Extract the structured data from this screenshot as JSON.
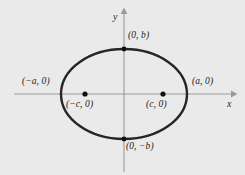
{
  "figure": {
    "type": "ellipse-diagram",
    "background_color": "#eaeaea",
    "curve_color": "#262626",
    "axis_color": "#9a9a9a",
    "point_color": "#111111",
    "text_color": "#1a1a1a"
  },
  "axes": {
    "x_label": "x",
    "y_label": "y",
    "origin_px": {
      "x": 124,
      "y": 94
    },
    "x_axis_from_px": 14,
    "x_axis_to_px": 236,
    "y_axis_from_px": 10,
    "y_axis_to_px": 172,
    "x_arrow": "arrow-right",
    "y_arrow": "arrow-up"
  },
  "chart_data": {
    "type": "scatter",
    "title": "",
    "xlabel": "x",
    "ylabel": "y",
    "curve": {
      "kind": "ellipse",
      "center": [
        0,
        0
      ],
      "semi_major_a": "a",
      "semi_minor_b": "b",
      "semi_major_px": 63,
      "semi_minor_px": 45,
      "center_px": [
        124,
        94
      ]
    },
    "points": [
      {
        "name": "vertex-right",
        "label": "(a, 0)",
        "px": [
          187,
          94
        ],
        "dot": false,
        "label_px": [
          192,
          77
        ]
      },
      {
        "name": "vertex-left",
        "label": "(−a, 0)",
        "px": [
          61,
          94
        ],
        "dot": false,
        "label_px": [
          22,
          77
        ]
      },
      {
        "name": "covertex-top",
        "label": "(0, b)",
        "px": [
          124,
          49
        ],
        "dot": true,
        "label_px": [
          128,
          31
        ]
      },
      {
        "name": "covertex-bottom",
        "label": "(0, −b)",
        "px": [
          124,
          139
        ],
        "dot": true,
        "label_px": [
          126,
          142
        ]
      },
      {
        "name": "focus-right",
        "label": "(c, 0)",
        "px": [
          163,
          94
        ],
        "dot": true,
        "label_px": [
          146,
          100
        ]
      },
      {
        "name": "focus-left",
        "label": "(−c, 0)",
        "px": [
          85,
          94
        ],
        "dot": true,
        "label_px": [
          66,
          100
        ]
      }
    ],
    "grid": false,
    "legend": null
  },
  "labels": {
    "top_vertex": "(0, b)",
    "bottom_vertex": "(0, −b)",
    "left_vertex": "(−a, 0)",
    "right_vertex": "(a, 0)",
    "left_focus": "(−c, 0)",
    "right_focus": "(c, 0)",
    "axis_x": "x",
    "axis_y": "y"
  }
}
